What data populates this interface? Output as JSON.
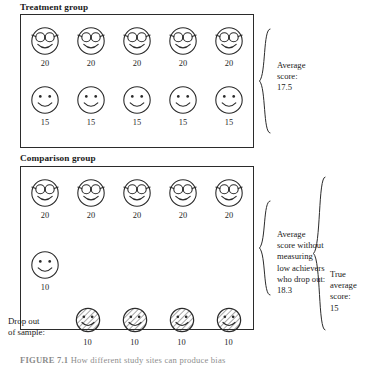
{
  "figure": {
    "caption": "FIGURE 7.1",
    "caption_rest": "   How different study sites can produce bias",
    "treatment": {
      "label": "Treatment group",
      "rows": [
        {
          "face_type": "glasses-face",
          "faces": [
            {
              "value": "20"
            },
            {
              "value": "20"
            },
            {
              "value": "20"
            },
            {
              "value": "20"
            },
            {
              "value": "20"
            }
          ]
        },
        {
          "face_type": "smiley-face",
          "faces": [
            {
              "value": "15"
            },
            {
              "value": "15"
            },
            {
              "value": "15"
            },
            {
              "value": "15"
            },
            {
              "value": "15"
            }
          ]
        }
      ],
      "annotation": "Average\nscore:\n17.5"
    },
    "comparison": {
      "label": "Comparison group",
      "rows": [
        {
          "face_type": "glasses-face",
          "faces": [
            {
              "value": "20"
            },
            {
              "value": "20"
            },
            {
              "value": "20"
            },
            {
              "value": "20"
            },
            {
              "value": "20"
            }
          ]
        },
        {
          "face_type": "smiley-face",
          "faces": [
            {
              "value": "10"
            }
          ]
        }
      ],
      "annotation": "Average\nscore without\nmeasuring\nlow achievers\nwho drop out:\n18.3"
    },
    "dropouts": {
      "label": "Drop out\nof sample:",
      "face_type": "hatched-face",
      "faces": [
        {
          "value": "10"
        },
        {
          "value": "10"
        },
        {
          "value": "10"
        },
        {
          "value": "10"
        }
      ]
    },
    "true_average": {
      "annotation": "True\naverage\nscore:\n15"
    }
  },
  "colors": {
    "ink": "#1a1a1a",
    "stroke": "#2b2b2b",
    "background": "#ffffff"
  }
}
